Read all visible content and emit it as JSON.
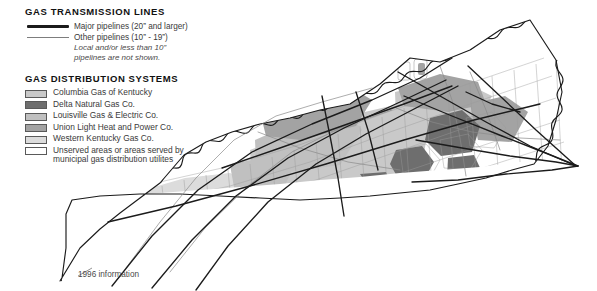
{
  "document": {
    "kind": "thematic-map",
    "subject": "Kentucky natural gas transmission lines and distribution systems",
    "footnote": "1996 information"
  },
  "legend": {
    "transmission": {
      "title": "GAS TRANSMISSION LINES",
      "rows": [
        {
          "key": "major-pipeline-line",
          "label": "Major pipelines (20” and larger)"
        },
        {
          "key": "other-pipeline-line",
          "label": "Other pipelines (10” - 19”)"
        }
      ],
      "note_line1": "Local and/or less than 10”",
      "note_line2": "pipelines are not shown."
    },
    "distribution": {
      "title": "GAS DISTRIBUTION SYSTEMS",
      "rows": [
        {
          "label": "Columbia Gas of Kentucky",
          "color": "#c9c9c9"
        },
        {
          "label": "Delta Natural Gas Co.",
          "color": "#6e6e6e"
        },
        {
          "label": "Louisville Gas & Electric Co.",
          "color": "#c0c0c0"
        },
        {
          "label": "Union Light Heat and Power Co.",
          "color": "#a3a3a3"
        },
        {
          "label": "Western Kentucky Gas Co.",
          "color": "#dcdcdc"
        },
        {
          "label": "Unserved areas or areas served by municipal gas distribution utilites",
          "color": "#ffffff"
        }
      ]
    }
  },
  "colors": {
    "major_pipeline": "#1b1b1b",
    "other_pipeline": "#7d7d7d",
    "state_outline": "#1b1b1b",
    "county_outline": "#9a9a9a",
    "background": "#ffffff"
  },
  "chart_data": {
    "type": "map",
    "projection_note": "state outline with county subdivisions",
    "categories": [
      "Columbia Gas of Kentucky",
      "Delta Natural Gas Co.",
      "Louisville Gas & Electric Co.",
      "Union Light Heat and Power Co.",
      "Western Kentucky Gas Co.",
      "Unserved areas or areas served by municipal gas distribution utilites"
    ],
    "fills": [
      "#c9c9c9",
      "#6e6e6e",
      "#c0c0c0",
      "#a3a3a3",
      "#dcdcdc",
      "#ffffff"
    ],
    "line_classes": [
      {
        "name": "Major pipelines (20” and larger)",
        "color": "#1b1b1b",
        "width": 1.5
      },
      {
        "name": "Other pipelines (10” - 19”)",
        "color": "#7d7d7d",
        "width": 0.7
      }
    ],
    "annotations": [
      "1996 information"
    ]
  }
}
